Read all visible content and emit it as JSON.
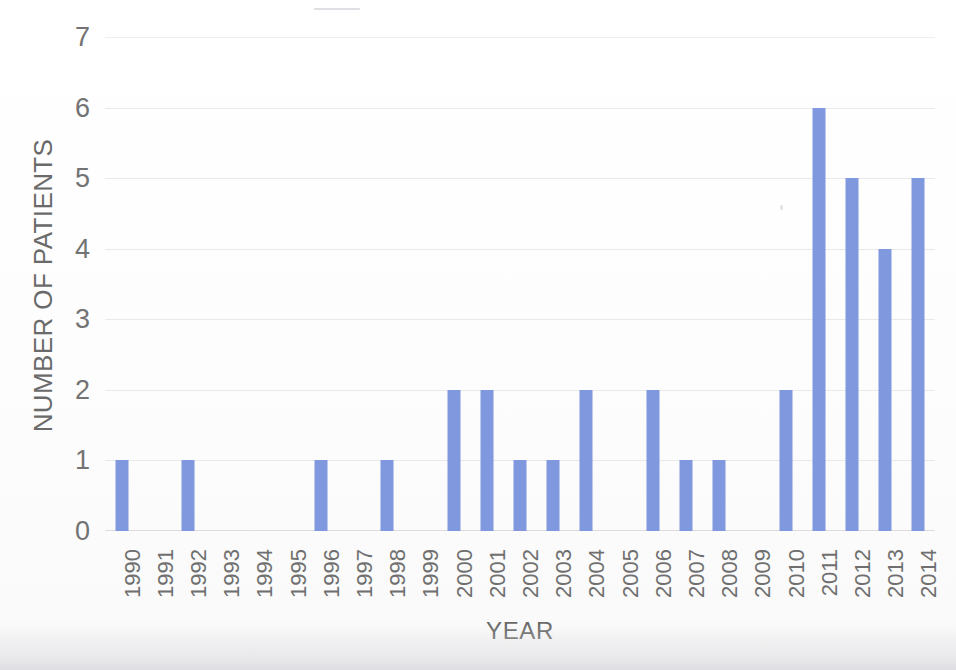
{
  "chart_data": {
    "type": "bar",
    "title": "",
    "xlabel": "YEAR",
    "ylabel": "NUMBER OF PATIENTS",
    "categories": [
      "1990",
      "1991",
      "1992",
      "1993",
      "1994",
      "1995",
      "1996",
      "1997",
      "1998",
      "1999",
      "2000",
      "2001",
      "2002",
      "2003",
      "2004",
      "2005",
      "2006",
      "2007",
      "2008",
      "2009",
      "2010",
      "2011",
      "2012",
      "2013",
      "2014"
    ],
    "values": [
      1,
      0,
      1,
      0,
      0,
      0,
      1,
      0,
      1,
      0,
      2,
      2,
      1,
      1,
      2,
      0,
      2,
      1,
      1,
      0,
      2,
      6,
      5,
      4,
      5
    ],
    "ylim": [
      0,
      7
    ],
    "y_ticks": [
      "0",
      "1",
      "2",
      "3",
      "4",
      "5",
      "6",
      "7"
    ],
    "grid": "horizontal",
    "legend": "none",
    "bar_color": "#8098dd",
    "gridline_color": "#e9e9ec",
    "axis_text_color": "#6f6f6f"
  }
}
